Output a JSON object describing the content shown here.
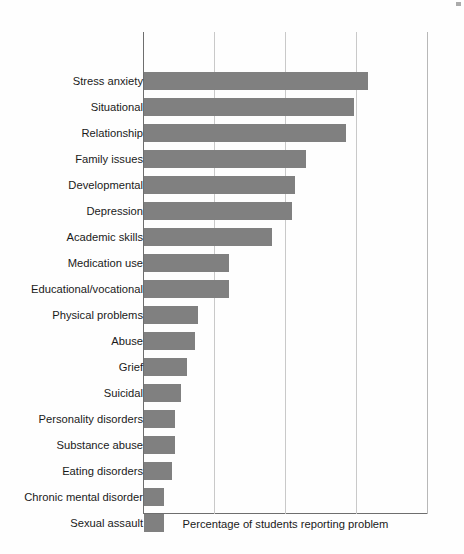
{
  "chart_data": {
    "type": "bar",
    "orientation": "horizontal",
    "title": "",
    "xlabel": "Percentage of students reporting problem",
    "ylabel": "",
    "xlim": [
      0,
      100
    ],
    "grid": true,
    "gridlines_x": [
      0,
      25,
      50,
      75,
      100
    ],
    "x_tick_labels": [],
    "legend": false,
    "bar_color": "#808080",
    "axis_color": "#6e6e6e",
    "grid_color": "#c9c9c9",
    "categories": [
      "Stress anxiety",
      "Situational",
      "Relationship",
      "Family issues",
      "Developmental",
      "Depression",
      "Academic skills",
      "Medication use",
      "Educational/vocational",
      "Physical problems",
      "Abuse",
      "Grief",
      "Suicidal",
      "Personality disorders",
      "Substance abuse",
      "Eating disorders",
      "Chronic mental disorder",
      "Sexual assault"
    ],
    "values": [
      79,
      74,
      71,
      57,
      53,
      52,
      45,
      30,
      30,
      19,
      18,
      15,
      13,
      11,
      11,
      10,
      7,
      7
    ]
  },
  "axis": {
    "x_caption": "Percentage of students reporting problem"
  }
}
